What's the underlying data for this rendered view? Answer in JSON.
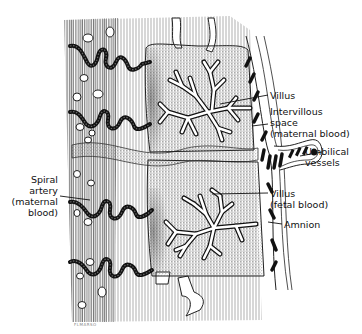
{
  "diagram": {
    "type": "anatomical-illustration",
    "labels": [
      {
        "id": "villus",
        "lines": [
          "Villus"
        ]
      },
      {
        "id": "intervillous-space",
        "lines": [
          "Intervillous",
          "space",
          "(maternal blood)"
        ]
      },
      {
        "id": "umbilical-vessels",
        "lines": [
          "Umbilical",
          "vessels"
        ]
      },
      {
        "id": "spiral-artery",
        "lines": [
          "Spiral",
          "artery",
          "(maternal",
          "blood)"
        ]
      },
      {
        "id": "villus-fetal",
        "lines": [
          "Villus",
          "(fetal blood)"
        ]
      },
      {
        "id": "amnion",
        "lines": [
          "Amnion"
        ]
      }
    ],
    "signature": "FLMARSO",
    "colors": {
      "ink": "#111111",
      "stipple": "#8a8a8a",
      "background": "#ffffff"
    }
  }
}
